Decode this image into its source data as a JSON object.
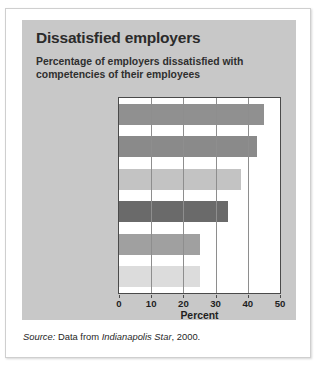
{
  "chart_data": {
    "type": "bar",
    "orientation": "horizontal",
    "title": "Dissatisfied employers",
    "subtitle": "Percentage of employers dissatisfied with competencies of their employees",
    "xlabel": "Percent",
    "ylabel": "",
    "xlim": [
      0,
      50
    ],
    "xticks": [
      0,
      10,
      20,
      30,
      40,
      50
    ],
    "xtick_labels": [
      "0",
      "10",
      "20",
      "30",
      "40",
      "50"
    ],
    "grid": "vertical",
    "legend": "none",
    "categories": [
      "Written\nCommunication",
      "Critical\nThinking",
      "Planning",
      "Oral\nCommunication",
      "Marketing/\nSales",
      "Public Relations"
    ],
    "values": [
      45,
      43,
      38,
      34,
      25,
      25
    ],
    "bar_colors": [
      "#909090",
      "#8a8a8a",
      "#c3c3c3",
      "#6a6a6a",
      "#a0a0a0",
      "#dcdcdc"
    ]
  },
  "source": {
    "label": "Source:",
    "text_before": " Data from ",
    "publication": "Indianapolis Star",
    "text_after": ", 2000."
  }
}
